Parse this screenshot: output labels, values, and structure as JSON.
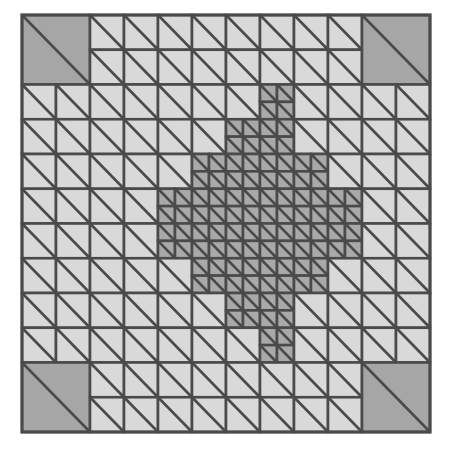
{
  "figure": {
    "type": "diagram",
    "background_color": "#ffffff",
    "stroke_color": "#4a4a4a",
    "stroke_width_px": 2.6,
    "domain": {
      "x0": 22,
      "y0": 15,
      "x1": 430,
      "y1": 432,
      "width_px": 408,
      "height_px": 417
    },
    "levels": [
      {
        "level": 1,
        "label": "coarse",
        "cells_per_side": 6,
        "cell_size_px": 68,
        "fill": "#a6a6a6"
      },
      {
        "level": 2,
        "label": "medium",
        "cells_per_side": 12,
        "cell_size_px": 34,
        "fill": "#d9d9d9"
      },
      {
        "level": 3,
        "label": "fine",
        "cells_per_side": 24,
        "cell_size_px": 17,
        "fill": "#a9a9a9"
      }
    ],
    "palette": {
      "coarse_gray": "#a6a6a6",
      "medium_light": "#d9d9d9",
      "fine_gray": "#a9a9a9",
      "edge": "#4a4a4a"
    },
    "outer_border": {
      "color": "#4a4a4a",
      "width_px": 3
    }
  },
  "mesh_data": {
    "grid_base": 6,
    "note": "Occupancy on the 6x6 level-1 lattice. 'L1' = one coarse cell (2 triangles). 'L2' = split into 2x2 medium cells (8 triangles). 'L3' = split into 4x4 fine cells (32 triangles).",
    "level_map": [
      [
        "L1",
        "L2",
        "L2",
        "L2",
        "L2",
        "L1"
      ],
      [
        "L2",
        "L2",
        "L2",
        "L3",
        "L2",
        "L2"
      ],
      [
        "L2",
        "L2",
        "L3",
        "L3",
        "L3",
        "L2"
      ],
      [
        "L2",
        "L2",
        "L3",
        "L3",
        "L3",
        "L2"
      ],
      [
        "L2",
        "L2",
        "L2",
        "L3",
        "L2",
        "L2"
      ],
      [
        "L1",
        "L2",
        "L2",
        "L2",
        "L2",
        "L1"
      ]
    ],
    "fine_subcell_overrides": {
      "note": "Within L3 blocks the refined core forms a plus/diamond. Some quadrants of border L3 blocks stay at medium (L2) size.",
      "r1c3": {
        "fine_quadrants": [
          "bl",
          "br",
          "tr"
        ],
        "medium_quadrants": [
          "tl"
        ]
      },
      "r2c2": {
        "fine_quadrants": [
          "tr",
          "bl",
          "br"
        ],
        "medium_quadrants": [
          "tl"
        ]
      },
      "r2c4": {
        "fine_quadrants": [
          "tl",
          "bl",
          "br"
        ],
        "medium_quadrants": [
          "tr"
        ]
      },
      "r3c2": {
        "fine_quadrants": [
          "tl",
          "tr",
          "br"
        ],
        "medium_quadrants": [
          "bl"
        ]
      },
      "r3c4": {
        "fine_quadrants": [
          "tl",
          "tr",
          "bl"
        ],
        "medium_quadrants": [
          "br"
        ]
      },
      "r4c3": {
        "fine_quadrants": [
          "tl",
          "tr",
          "br"
        ],
        "medium_quadrants": [
          "bl"
        ]
      }
    },
    "counts": {
      "level1_cells": 4,
      "level2_cells": 96,
      "level3_cells": 236,
      "total_triangles": 672
    }
  }
}
